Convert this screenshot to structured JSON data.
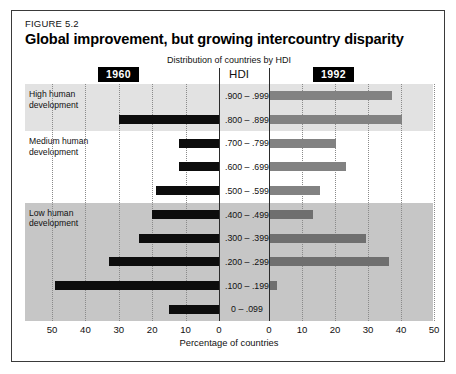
{
  "figure": {
    "label": "FIGURE 5.2",
    "title": "Global improvement, but growing intercountry disparity",
    "subtitle": "Distribution of countries by HDI",
    "center_header": "HDI",
    "left_series_tag": "1960",
    "right_series_tag": "1992",
    "xaxis_title": "Percentage of countries"
  },
  "bands": [
    {
      "label": "High human\ndevelopment",
      "shade": "#e2e2e2"
    },
    {
      "label": "Medium human\ndevelopment",
      "shade": "#ffffff"
    },
    {
      "label": "Low human\ndevelopment",
      "shade": "#c6c6c6"
    }
  ],
  "colors": {
    "bar_1960": "#0d0d0d",
    "bar_1992": "#828282",
    "band_high": "#e2e2e2",
    "band_medium": "#ffffff",
    "band_low": "#c6c6c6",
    "frame": "#3a3a3a",
    "gridline": "#8a8a8a"
  },
  "chart_data": {
    "type": "bar",
    "title": "Global improvement, but growing intercountry disparity",
    "subtitle": "Distribution of countries by HDI",
    "orientation": "horizontal-diverging",
    "xlabel": "Percentage of countries",
    "ylabel": "HDI",
    "categories": [
      ".900 – .999",
      ".800 – .899",
      ".700 – .799",
      ".600 – .699",
      ".500 – .599",
      ".400 – .499",
      ".300 – .399",
      ".200 – .299",
      ".100 – .199",
      "0 – .099"
    ],
    "category_groups": [
      {
        "name": "High human development",
        "categories": [
          ".900 – .999",
          ".800 – .899"
        ]
      },
      {
        "name": "Medium human development",
        "categories": [
          ".700 – .799",
          ".600 – .699",
          ".500 – .599"
        ]
      },
      {
        "name": "Low human development",
        "categories": [
          ".400 – .499",
          ".300 – .399",
          ".200 – .299",
          ".100 – .199",
          "0 – .099"
        ]
      }
    ],
    "series": [
      {
        "name": "1960",
        "side": "left",
        "values": [
          0,
          30,
          12,
          12,
          19,
          20,
          24,
          33,
          49,
          15
        ]
      },
      {
        "name": "1992",
        "side": "right",
        "values": [
          37,
          40,
          20,
          23,
          15,
          13,
          29,
          36,
          2,
          0
        ]
      }
    ],
    "xlim_left": [
      0,
      50
    ],
    "xlim_right": [
      0,
      50
    ],
    "xticks_left": [
      50,
      40,
      30,
      20,
      10,
      0
    ],
    "xticks_right": [
      0,
      10,
      20,
      30,
      40,
      50
    ],
    "grid": true,
    "legend": "inline-tags"
  }
}
